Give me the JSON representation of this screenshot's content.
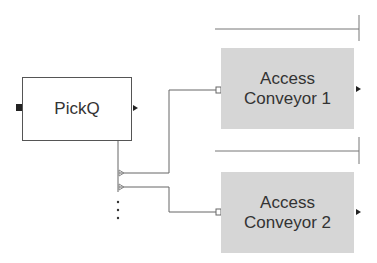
{
  "diagram": {
    "blocks": [
      {
        "id": "pickq",
        "label": "PickQ"
      },
      {
        "id": "conveyor1",
        "label": "Access\nConveyor 1"
      },
      {
        "id": "conveyor2",
        "label": "Access\nConveyor 2"
      }
    ],
    "continuation": "⋮",
    "colors": {
      "line": "#666666",
      "conveyor_fill": "#d6d6d6",
      "border": "#555555"
    }
  }
}
